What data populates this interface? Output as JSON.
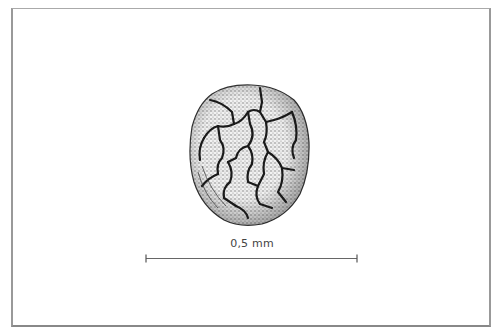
{
  "figure": {
    "scale_bar": {
      "label": "0,5 mm",
      "color": "#555555"
    },
    "colors": {
      "background": "#ffffff",
      "frame": "#999999",
      "stipple": "#555555",
      "ridges": "#1a1a1a"
    }
  }
}
